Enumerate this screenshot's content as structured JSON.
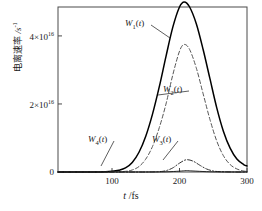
{
  "chart_data": {
    "type": "line",
    "title": "",
    "xlabel": "t /fs",
    "ylabel": "电离速率 /s⁻¹",
    "ylabel_cn": "电离速率",
    "ylabel_unit": "/s",
    "ylabel_unit_exp": "-1",
    "xlim": [
      20,
      300
    ],
    "ylim": [
      0,
      4.85e+16
    ],
    "grid": false,
    "legend": "inline-annotations",
    "xticks": [
      100,
      200,
      300
    ],
    "xtick_labels": [
      "100",
      "200",
      "300"
    ],
    "yticks": [
      0,
      2e+16,
      4e+16
    ],
    "ytick_labels": [
      "0",
      "2×10",
      "4×10"
    ],
    "ytick_exponents": [
      "",
      "16",
      "16"
    ],
    "series": [
      {
        "name": "W1(t)",
        "label": "W",
        "label_sub": "1",
        "label_suffix": "(t)",
        "style": "solid",
        "color": "#000000",
        "peak_x": 207,
        "peak_y": 5e+16,
        "width_fwhm": 95,
        "x": [
          20,
          40,
          60,
          80,
          100,
          110,
          120,
          130,
          140,
          150,
          160,
          170,
          180,
          190,
          200,
          207,
          215,
          225,
          235,
          245,
          255,
          265,
          275,
          285,
          295,
          300
        ],
        "y": [
          0,
          0,
          0,
          0,
          200000000000000.0,
          500000000000000.0,
          1200000000000000.0,
          2800000000000000.0,
          5800000000000000.0,
          1.05e+16,
          1.7e+16,
          2.5e+16,
          3.4e+16,
          4.25e+16,
          4.85e+16,
          5e+16,
          4.85e+16,
          4.35e+16,
          3.6e+16,
          2.75e+16,
          1.9e+16,
          1.2e+16,
          7000000000000000.0,
          3800000000000000.0,
          2200000000000000.0,
          1800000000000000.0
        ]
      },
      {
        "name": "W2(t)",
        "label": "W",
        "label_sub": "2",
        "label_suffix": "(t)",
        "style": "dashed",
        "color": "#555555",
        "peak_x": 207,
        "peak_y": 3.75e+16,
        "width_fwhm": 72,
        "x": [
          20,
          60,
          100,
          120,
          130,
          140,
          150,
          160,
          170,
          180,
          190,
          200,
          207,
          215,
          225,
          235,
          245,
          255,
          265,
          275,
          285,
          295,
          300
        ],
        "y": [
          0,
          0,
          0,
          200000000000000.0,
          600000000000000.0,
          1600000000000000.0,
          3800000000000000.0,
          7500000000000000.0,
          1.3e+16,
          2e+16,
          2.85e+16,
          3.55e+16,
          3.75e+16,
          3.6e+16,
          3.05e+16,
          2.3e+16,
          1.55e+16,
          9200000000000000.0,
          4800000000000000.0,
          2200000000000000.0,
          900000000000000.0,
          300000000000000.0,
          200000000000000.0
        ]
      },
      {
        "name": "W3(t)",
        "label": "W",
        "label_sub": "3",
        "label_suffix": "(t)",
        "style": "dashdot",
        "color": "#333333",
        "peak_x": 210,
        "peak_y": 3600000000000000.0,
        "width_fwhm": 40,
        "x": [
          20,
          100,
          150,
          170,
          180,
          190,
          200,
          210,
          220,
          230,
          240,
          250,
          260,
          280,
          300
        ],
        "y": [
          0,
          0,
          0,
          100000000000000.0,
          400000000000000.0,
          1200000000000000.0,
          2600000000000000.0,
          3600000000000000.0,
          3200000000000000.0,
          2000000000000000.0,
          900000000000000.0,
          300000000000000.0,
          100000000000000.0,
          0,
          0
        ]
      },
      {
        "name": "W4(t)",
        "label": "W",
        "label_sub": "4",
        "label_suffix": "(t)",
        "style": "solid-thin",
        "color": "#000000",
        "peak_x": 210,
        "peak_y": 400000000000000.0,
        "width_fwhm": 45,
        "x": [
          20,
          100,
          150,
          180,
          200,
          210,
          220,
          240,
          260,
          300
        ],
        "y": [
          0,
          0,
          0,
          50000000000000.0,
          250000000000000.0,
          400000000000000.0,
          300000000000000.0,
          100000000000000.0,
          20000000000000.0,
          0
        ]
      }
    ],
    "annotations": [
      {
        "text": "W1(t)",
        "x_px": 125,
        "y_px": 24,
        "leader_to_x_px": 170,
        "leader_to_y_px": 38
      },
      {
        "text": "W2(t)",
        "x_px": 163,
        "y_px": 90,
        "leader_to_x_px": 158,
        "leader_to_y_px": 95
      },
      {
        "text": "W3(t)",
        "x_px": 152,
        "y_px": 140,
        "leader_to_x_px": 163,
        "leader_to_y_px": 160
      },
      {
        "text": "W4(t)",
        "x_px": 88,
        "y_px": 140,
        "leader_to_x_px": 101,
        "leader_to_y_px": 166
      }
    ]
  },
  "plot_box": {
    "left": 58,
    "top": 7,
    "right": 247,
    "bottom": 172
  }
}
